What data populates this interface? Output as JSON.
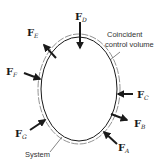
{
  "diagram": {
    "colors": {
      "background": "#ffffff",
      "system_stroke": "#1a1a1a",
      "control_volume_stroke": "#666666",
      "arrow": "#1a1a1a",
      "text": "#1a1a1a"
    },
    "labels": {
      "control_volume": [
        "Coincident",
        "control volume"
      ],
      "system": "System"
    },
    "forces": [
      {
        "id": "A",
        "symbol": "F",
        "subscript": "A",
        "direction": "inward"
      },
      {
        "id": "B",
        "symbol": "F",
        "subscript": "B",
        "direction": "outward"
      },
      {
        "id": "C",
        "symbol": "F",
        "subscript": "C",
        "direction": "inward"
      },
      {
        "id": "D",
        "symbol": "F",
        "subscript": "D",
        "direction": "inward"
      },
      {
        "id": "E",
        "symbol": "F",
        "subscript": "E",
        "direction": "outward"
      },
      {
        "id": "F",
        "symbol": "F",
        "subscript": "F",
        "direction": "inward"
      },
      {
        "id": "G",
        "symbol": "F",
        "subscript": "G",
        "direction": "inward"
      }
    ]
  }
}
